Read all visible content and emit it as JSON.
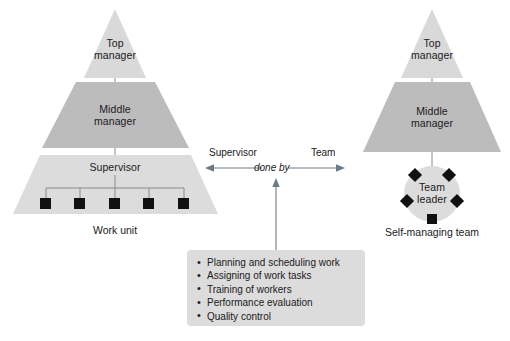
{
  "diagram": {
    "title_text": "",
    "colors": {
      "tier_light": "#d9d9d9",
      "tier_mid": "#bcbcbc",
      "tier_base": "#dcdcdc",
      "node_fill": "#111111",
      "line": "#8a8a8a",
      "arrow": "#6e7a86",
      "box_fill": "#dcdcdc",
      "text": "#1a1a1a",
      "background": "#ffffff"
    },
    "left_structure": {
      "caption": "Work unit",
      "tiers": [
        {
          "label": "Top manager",
          "label_line1": "Top",
          "label_line2": "manager"
        },
        {
          "label": "Middle manager",
          "label_line1": "Middle",
          "label_line2": "manager"
        },
        {
          "label": "Supervisor"
        }
      ],
      "worker_count": 5
    },
    "right_structure": {
      "caption": "Self-managing team",
      "tiers": [
        {
          "label": "Top manager",
          "label_line1": "Top",
          "label_line2": "manager"
        },
        {
          "label": "Middle manager",
          "label_line1": "Middle",
          "label_line2": "manager"
        }
      ],
      "team": {
        "label_line1": "Team",
        "label_line2": "leader",
        "member_count": 5
      }
    },
    "center_relation": {
      "left_label": "Supervisor",
      "right_label": "Team",
      "middle_label": "done by"
    },
    "task_list": {
      "items": [
        "Planning and scheduling work",
        "Assigning of work tasks",
        "Training of workers",
        "Performance evaluation",
        "Quality control"
      ]
    }
  }
}
